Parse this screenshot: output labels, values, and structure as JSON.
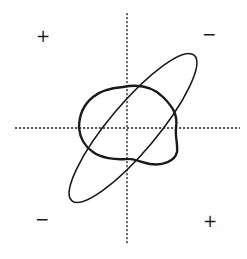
{
  "diagram": {
    "colors": {
      "background": "#ffffff",
      "ink": "#1a1a1a",
      "axis": "#222222"
    },
    "axes": {
      "style": "dotted",
      "horizontal": {
        "y": 128,
        "x_start": 15,
        "x_end": 240
      },
      "vertical": {
        "x": 127,
        "y_start": 13,
        "y_end": 244
      }
    },
    "quadrant_signs": {
      "top_left": "+",
      "top_right": "−",
      "bottom_left": "−",
      "bottom_right": "+"
    },
    "curves": [
      {
        "name": "tilted-ellipse",
        "stroke": "thin",
        "orientation": "major axis from lower-left to upper-right"
      },
      {
        "name": "irregular-loop",
        "stroke": "thick",
        "orientation": "roughly centered on origin, closed blob"
      }
    ]
  }
}
